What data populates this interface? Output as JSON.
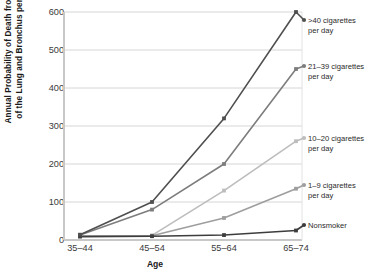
{
  "chart_data": {
    "type": "line",
    "title": "",
    "xlabel": "Age",
    "ylabel": "Annual Probability of Death from Cancer of the Lung and Bronchus per 100 000",
    "ylabel_line1": "Annual Probability of Death from Cancer",
    "ylabel_line2": "of the Lung and Bronchus per 100 000",
    "categories": [
      "35–44",
      "45–54",
      "55–64",
      "65–74"
    ],
    "yticks": [
      0,
      100,
      200,
      300,
      400,
      500,
      600
    ],
    "ylim": [
      0,
      600
    ],
    "grid": true,
    "legend_position": "right",
    "series": [
      {
        "name": ">40 cigarettes per day",
        "label_line1": ">40 cigarettes",
        "label_line2": "per day",
        "color": "#4f4f4f",
        "values": [
          14,
          100,
          320,
          600
        ]
      },
      {
        "name": "21–39 cigarettes per day",
        "label_line1": "21–39 cigarettes",
        "label_line2": "per day",
        "color": "#7d7d7d",
        "values": [
          13,
          80,
          200,
          450
        ]
      },
      {
        "name": "10–20 cigarettes per day",
        "label_line1": "10–20 cigarettes",
        "label_line2": "per day",
        "color": "#bdbdbd",
        "values": [
          11,
          12,
          130,
          260
        ]
      },
      {
        "name": "1–9 cigarettes per day",
        "label_line1": "1–9 cigarettes",
        "label_line2": "per day",
        "color": "#9e9e9e",
        "values": [
          10,
          11,
          58,
          135
        ]
      },
      {
        "name": "Nonsmoker",
        "label_line1": "Nonsmoker",
        "label_line2": "",
        "color": "#3d3d3d",
        "values": [
          9,
          10,
          13,
          25
        ]
      }
    ]
  },
  "axis": {
    "x_title": "Age"
  }
}
